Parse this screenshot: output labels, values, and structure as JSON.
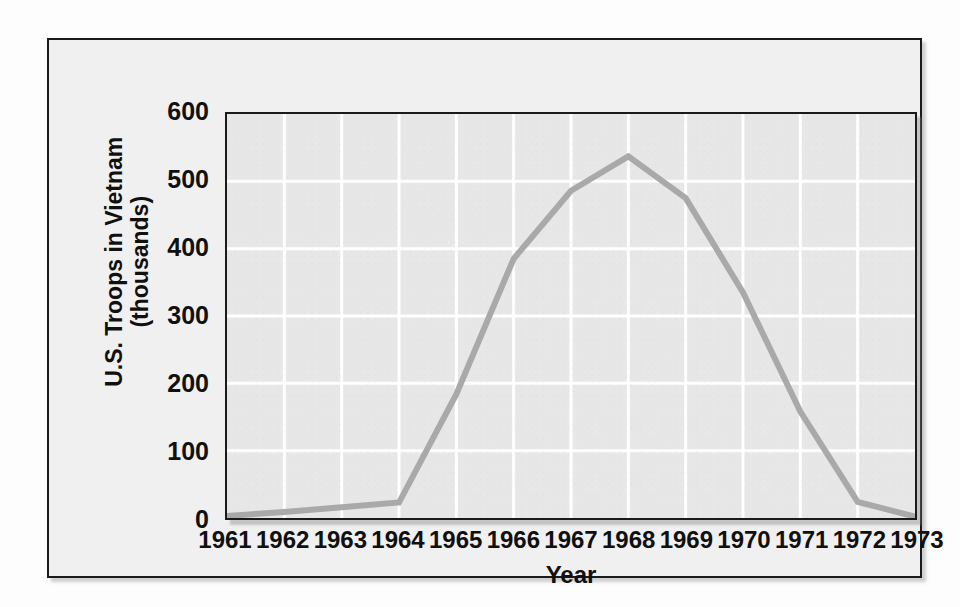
{
  "figure": {
    "background_color": "#fdfdfd",
    "panel_background": "#f0f0f0",
    "panel_border_color": "#1a1a1a",
    "plot_background": "#e7e7e7",
    "gridline_color": "#ffffff",
    "line_color": "#a9a9a9",
    "text_color": "#101010"
  },
  "chart_data": {
    "type": "line",
    "title": "",
    "xlabel": "Year",
    "ylabel": "U.S. Troops in Vietnam (thousands)",
    "ylabel_line1": "U.S. Troops in Vietnam",
    "ylabel_line2": "(thousands)",
    "categories": [
      "1961",
      "1962",
      "1963",
      "1964",
      "1965",
      "1966",
      "1967",
      "1968",
      "1969",
      "1970",
      "1971",
      "1972",
      "1973"
    ],
    "x": [
      1961,
      1962,
      1963,
      1964,
      1965,
      1966,
      1967,
      1968,
      1969,
      1970,
      1971,
      1972,
      1973
    ],
    "values": [
      3,
      9,
      16,
      23,
      184,
      385,
      486,
      537,
      475,
      335,
      158,
      24,
      2
    ],
    "series": [
      {
        "name": "U.S. Troops in Vietnam (thousands)",
        "values": [
          3,
          9,
          16,
          23,
          184,
          385,
          486,
          537,
          475,
          335,
          158,
          24,
          2
        ],
        "color": "#a9a9a9"
      }
    ],
    "ylim": [
      0,
      600
    ],
    "yticks": [
      0,
      100,
      200,
      300,
      400,
      500,
      600
    ],
    "ytick_labels": [
      "0",
      "100",
      "200",
      "300",
      "400",
      "500",
      "600"
    ],
    "xlim": [
      1961,
      1973
    ],
    "grid": true,
    "grid_axis": "both",
    "legend": false,
    "legend_position": "none",
    "markers": false,
    "line_width": 6
  }
}
